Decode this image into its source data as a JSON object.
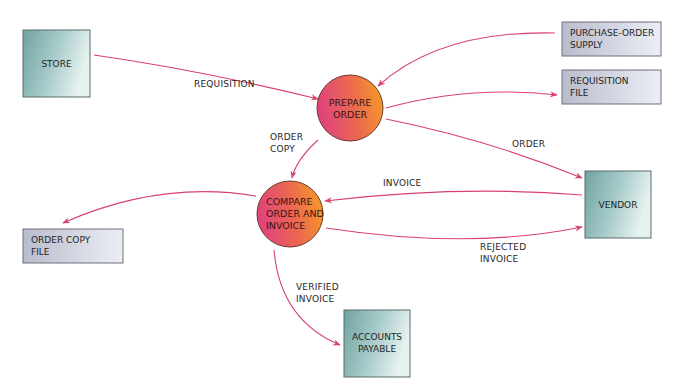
{
  "diagram": {
    "type": "data-flow-diagram",
    "colors": {
      "flow": "#d8406e",
      "entity_dark": "#6fa3a3",
      "entity_light": "#e6f2f0",
      "store_dark": "#b9bccc",
      "store_light": "#eceef6",
      "process_left": "#e0457a",
      "process_right": "#f7a023"
    },
    "external_entities": [
      {
        "id": "store",
        "lines": [
          "STORE"
        ]
      },
      {
        "id": "vendor",
        "lines": [
          "VENDOR"
        ]
      },
      {
        "id": "accounts-payable",
        "lines": [
          "ACCOUNTS",
          "PAYABLE"
        ]
      }
    ],
    "processes": [
      {
        "id": "prepare-order",
        "lines": [
          "PREPARE",
          "ORDER"
        ]
      },
      {
        "id": "compare-order-invoice",
        "lines": [
          "COMPARE",
          "ORDER AND",
          "INVOICE"
        ]
      }
    ],
    "data_stores": [
      {
        "id": "purchase-order-supply",
        "lines": [
          "PURCHASE-ORDER",
          "SUPPLY"
        ]
      },
      {
        "id": "requisition-file",
        "lines": [
          "REQUISITION",
          "FILE"
        ]
      },
      {
        "id": "order-copy-file",
        "lines": [
          "ORDER COPY",
          "FILE"
        ]
      }
    ],
    "flows": [
      {
        "from": "store",
        "to": "prepare-order",
        "label": [
          "REQUISITION"
        ]
      },
      {
        "from": "purchase-order-supply",
        "to": "prepare-order",
        "label": []
      },
      {
        "from": "prepare-order",
        "to": "requisition-file",
        "label": []
      },
      {
        "from": "prepare-order",
        "to": "vendor",
        "label": [
          "ORDER"
        ]
      },
      {
        "from": "prepare-order",
        "to": "compare-order-invoice",
        "label": [
          "ORDER",
          "COPY"
        ]
      },
      {
        "from": "vendor",
        "to": "compare-order-invoice",
        "label": [
          "INVOICE"
        ]
      },
      {
        "from": "compare-order-invoice",
        "to": "vendor",
        "label": [
          "REJECTED",
          "INVOICE"
        ]
      },
      {
        "from": "compare-order-invoice",
        "to": "order-copy-file",
        "label": []
      },
      {
        "from": "compare-order-invoice",
        "to": "accounts-payable",
        "label": [
          "VERIFIED",
          "INVOICE"
        ]
      }
    ]
  }
}
